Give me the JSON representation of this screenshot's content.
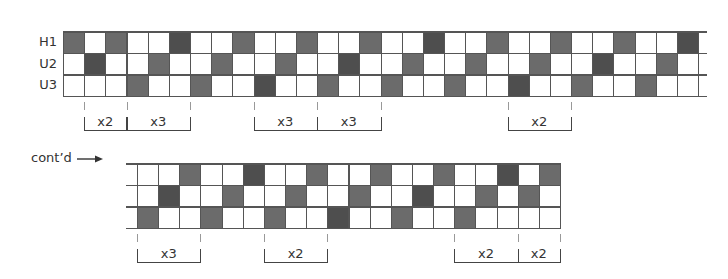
{
  "diagram": {
    "top_grid": {
      "rows": [
        {
          "label": "H1",
          "shaded": [
            0,
            2,
            5,
            8,
            11,
            14,
            17,
            20,
            23,
            26,
            29
          ]
        },
        {
          "label": "U2",
          "shaded": [
            1,
            4,
            7,
            10,
            13,
            16,
            19,
            22,
            25,
            28
          ]
        },
        {
          "label": "U3",
          "shaded": [
            3,
            6,
            9,
            12,
            15,
            18,
            21,
            24,
            27
          ]
        }
      ],
      "columns": 30,
      "brackets": [
        {
          "from": 1,
          "to": 3,
          "label": "x2"
        },
        {
          "from": 3,
          "to": 6,
          "label": "x3"
        },
        {
          "from": 9,
          "to": 12,
          "label": "x3"
        },
        {
          "from": 12,
          "to": 15,
          "label": "x3"
        },
        {
          "from": 21,
          "to": 24,
          "label": "x2"
        }
      ]
    },
    "continuation_label": "cont’d",
    "bottom_grid": {
      "rows": [
        {
          "label": "",
          "shaded": [
            2,
            5,
            8,
            11,
            14,
            17,
            19
          ]
        },
        {
          "label": "",
          "shaded": [
            1,
            4,
            7,
            10,
            13,
            16,
            18
          ]
        },
        {
          "label": "",
          "shaded": [
            0,
            3,
            6,
            9,
            12,
            15
          ]
        }
      ],
      "columns": 20,
      "brackets": [
        {
          "from": 0,
          "to": 3,
          "label": "x3"
        },
        {
          "from": 6,
          "to": 9,
          "label": "x2"
        },
        {
          "from": 15,
          "to": 18,
          "label": "x2"
        },
        {
          "from": 18,
          "to": 20,
          "label": "x2"
        }
      ]
    },
    "colors": {
      "shaded": "#6b6b6b",
      "shaded_dark": "#4e4e4e",
      "line": "#555555",
      "empty": "#ffffff"
    }
  }
}
